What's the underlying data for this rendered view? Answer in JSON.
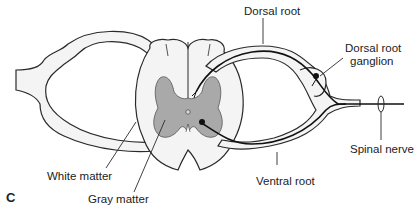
{
  "figure": {
    "panel_letter": "C",
    "labels": {
      "dorsal_root": "Dorsal root",
      "dorsal_root_ganglion_line1": "Dorsal root",
      "dorsal_root_ganglion_line2": "ganglion",
      "spinal_nerve": "Spinal nerve",
      "ventral_root": "Ventral root",
      "white_matter": "White matter",
      "gray_matter": "Gray matter"
    },
    "colors": {
      "outline": "#2a2a2a",
      "white_matter_fill": "#f4f4f4",
      "gray_matter_fill": "#a9a9a9",
      "background": "#ffffff"
    }
  }
}
